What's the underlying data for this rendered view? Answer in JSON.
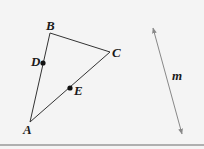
{
  "diagram": {
    "background": "#f4f4f4",
    "stroke_color": "#333333",
    "line_m_color": "#888888",
    "points": {
      "A": {
        "label": "A",
        "x": 30,
        "y": 122
      },
      "B": {
        "label": "B",
        "x": 50,
        "y": 33
      },
      "C": {
        "label": "C",
        "x": 110,
        "y": 52
      },
      "D": {
        "label": "D",
        "x": 43,
        "y": 63
      },
      "E": {
        "label": "E",
        "x": 70,
        "y": 88
      }
    },
    "triangle": [
      "A",
      "B",
      "C"
    ],
    "marked_points": [
      "D",
      "E"
    ],
    "line": {
      "label": "m",
      "x1": 153,
      "y1": 28,
      "x2": 182,
      "y2": 134,
      "arrows": "both"
    }
  }
}
